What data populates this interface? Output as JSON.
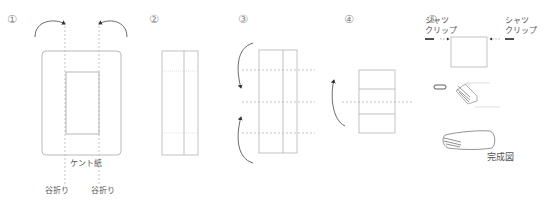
{
  "steps": [
    {
      "number": "①",
      "labels": {
        "paper": "ケント紙",
        "fold_left": "谷折り",
        "fold_right": "谷折り"
      }
    },
    {
      "number": "②"
    },
    {
      "number": "③"
    },
    {
      "number": "④"
    },
    {
      "number": "⑤",
      "labels": {
        "clip_left_1": "シャツ",
        "clip_left_2": "クリップ",
        "clip_right_1": "シャツ",
        "clip_right_2": "クリップ",
        "complete": "完成図"
      }
    }
  ],
  "colors": {
    "line": "#9a9a9a",
    "dash": "#aaaaaa",
    "arrow": "#333333",
    "text": "#555555"
  }
}
